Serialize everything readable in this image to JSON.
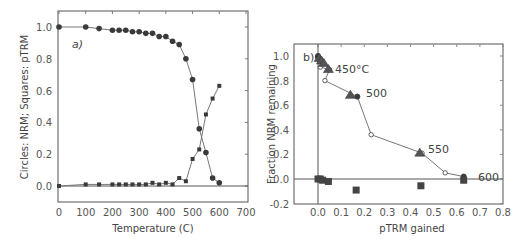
{
  "chart_data": [
    {
      "type": "line",
      "panel_label": "a)",
      "xlabel": "Temperature (C)",
      "ylabel": "Circles: NRM; Squares: pTRM",
      "xlim": [
        0,
        700
      ],
      "ylim": [
        -0.1,
        1.1
      ],
      "xticks": [
        "0",
        "100",
        "200",
        "300",
        "400",
        "500",
        "600",
        "700"
      ],
      "yticks": [
        "0.0",
        "0.2",
        "0.4",
        "0.6",
        "0.8",
        "1.0"
      ],
      "grid": false,
      "x": [
        0,
        100,
        150,
        200,
        225,
        250,
        275,
        300,
        325,
        350,
        375,
        400,
        425,
        450,
        475,
        500,
        525,
        550,
        575,
        600
      ],
      "series": [
        {
          "name": "NRM (circles)",
          "marker": "circle",
          "values": [
            1.0,
            1.0,
            0.99,
            0.98,
            0.98,
            0.98,
            0.97,
            0.97,
            0.96,
            0.96,
            0.94,
            0.94,
            0.91,
            0.89,
            0.8,
            0.67,
            0.36,
            0.21,
            0.05,
            0.02
          ]
        },
        {
          "name": "pTRM (squares)",
          "marker": "square",
          "values": [
            0.0,
            0.01,
            0.01,
            0.01,
            0.01,
            0.01,
            0.01,
            0.01,
            0.01,
            0.02,
            0.01,
            0.02,
            0.01,
            0.05,
            0.03,
            0.17,
            0.23,
            0.45,
            0.55,
            0.63
          ]
        }
      ]
    },
    {
      "type": "scatter",
      "panel_label": "b)",
      "xlabel": "pTRM gained",
      "ylabel": "Fraction NRM remaining",
      "xlim": [
        -0.1,
        0.8
      ],
      "ylim": [
        -0.2,
        1.1
      ],
      "xticks": [
        "0.0",
        "0.1",
        "0.2",
        "0.3",
        "0.4",
        "0.5",
        "0.6",
        "0.7",
        "0.8"
      ],
      "yticks": [
        "-0.2",
        "0.0",
        "0.2",
        "0.4",
        "0.6",
        "0.8",
        "1.0"
      ],
      "grid": false,
      "annotations": [
        {
          "text": "450°C",
          "x": 0.07,
          "y": 0.89
        },
        {
          "text": "500",
          "x": 0.2,
          "y": 0.68
        },
        {
          "text": "550",
          "x": 0.48,
          "y": 0.23
        },
        {
          "text": "600",
          "x": 0.68,
          "y": 0.02
        }
      ],
      "series": [
        {
          "name": "NRM-pTRM points (line)",
          "marker": "circle-open",
          "points": [
            [
              0.0,
              1.0
            ],
            [
              0.0,
              0.99
            ],
            [
              0.005,
              0.98
            ],
            [
              0.01,
              0.97
            ],
            [
              0.015,
              0.96
            ],
            [
              0.02,
              0.94
            ],
            [
              0.01,
              0.91
            ],
            [
              0.05,
              0.89
            ],
            [
              0.03,
              0.8
            ],
            [
              0.17,
              0.67
            ],
            [
              0.23,
              0.36
            ],
            [
              0.45,
              0.21
            ],
            [
              0.55,
              0.05
            ],
            [
              0.63,
              0.02
            ]
          ]
        },
        {
          "name": "pTRM checks",
          "marker": "triangle",
          "points": [
            [
              0.005,
              0.98
            ],
            [
              0.015,
              0.96
            ],
            [
              0.025,
              0.94
            ],
            [
              0.045,
              0.89
            ],
            [
              0.14,
              0.68
            ],
            [
              0.44,
              0.21
            ]
          ]
        },
        {
          "name": "tail checks",
          "marker": "square",
          "points": [
            [
              0.0,
              0.0
            ],
            [
              0.01,
              0.0
            ],
            [
              0.02,
              -0.01
            ],
            [
              0.045,
              -0.02
            ],
            [
              0.165,
              -0.09
            ],
            [
              0.445,
              -0.055
            ],
            [
              0.63,
              -0.01
            ]
          ]
        }
      ]
    }
  ],
  "panel_a": {
    "label": "a)",
    "xlabel": "Temperature (C)",
    "ylabel": "Circles: NRM; Squares: pTRM"
  },
  "panel_b": {
    "label": "b)",
    "xlabel": "pTRM gained",
    "ylabel": "Fraction NRM remaining",
    "ann": [
      "450°C",
      "500",
      "550",
      "600"
    ]
  }
}
